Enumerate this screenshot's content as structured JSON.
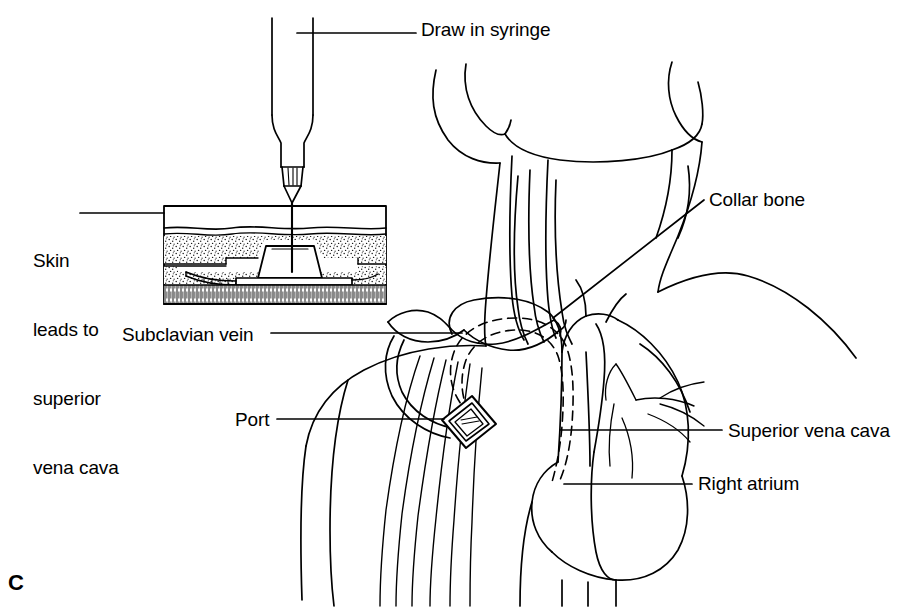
{
  "figure": {
    "panel_letter": "C",
    "background_color": "#ffffff",
    "line_color": "#000000"
  },
  "labels": {
    "draw_in_syringe": "Draw in syringe",
    "collar_bone": "Collar bone",
    "skin_line_1": "Skin",
    "skin_line_2": "leads to",
    "skin_line_3": "superior",
    "skin_line_4": "vena cava",
    "subclavian_vein": "Subclavian vein",
    "port": "Port",
    "superior_vena_cava": "Superior vena cava",
    "right_atrium": "Right atrium"
  },
  "inset": {
    "name": "skin-cross-section",
    "layers": [
      "epidermis",
      "subcutaneous-fat",
      "deep-fat",
      "muscle"
    ],
    "contains": [
      "implanted-port",
      "catheter-tube",
      "needle"
    ]
  },
  "anatomy": {
    "parts": [
      "head-and-jaw",
      "neck-muscles",
      "clavicle",
      "shoulder",
      "rib-cage",
      "subclavian-vein",
      "superior-vena-cava",
      "right-atrium",
      "heart",
      "aortic-arch",
      "coronary-vessels",
      "catheter-path"
    ]
  },
  "instrument": {
    "name": "syringe",
    "parts": [
      "barrel",
      "shoulder-taper",
      "luer-hub",
      "cone-tip",
      "needle"
    ]
  }
}
